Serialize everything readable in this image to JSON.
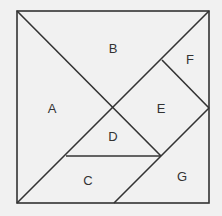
{
  "diagram": {
    "pieces": [
      {
        "id": "A",
        "label": "A"
      },
      {
        "id": "B",
        "label": "B"
      },
      {
        "id": "C",
        "label": "C"
      },
      {
        "id": "D",
        "label": "D"
      },
      {
        "id": "E",
        "label": "E"
      },
      {
        "id": "F",
        "label": "F"
      },
      {
        "id": "G",
        "label": "G"
      }
    ],
    "colors": {
      "line": "#333333",
      "background": "#f1f1f1"
    }
  }
}
